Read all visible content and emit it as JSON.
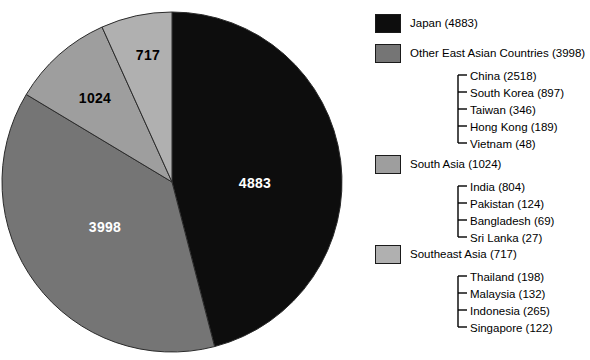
{
  "chart_data": {
    "type": "pie",
    "title": "",
    "legend_position": "right",
    "total": 10622,
    "categories": [
      "Japan",
      "Other East Asian Countries",
      "South Asia",
      "Southeast Asia"
    ],
    "values": [
      4883,
      3998,
      1024,
      717
    ],
    "colors": [
      "#0d0d0d",
      "#757575",
      "#9e9e9e",
      "#b0b0b0"
    ],
    "start_angle_deg": 0,
    "direction": "clockwise",
    "slices": [
      {
        "name": "Japan",
        "value": 4883,
        "label": "4883",
        "color": "#0d0d0d",
        "label_color": "#ffffff"
      },
      {
        "name": "Other East Asian Countries",
        "value": 3998,
        "label": "3998",
        "color": "#757575",
        "label_color": "#ffffff"
      },
      {
        "name": "South Asia",
        "value": 1024,
        "label": "1024",
        "color": "#9e9e9e",
        "label_color": "#000000"
      },
      {
        "name": "Southeast Asia",
        "value": 717,
        "label": "717",
        "color": "#b0b0b0",
        "label_color": "#000000"
      }
    ],
    "breakdown": {
      "Other East Asian Countries": [
        {
          "name": "China",
          "value": 2518
        },
        {
          "name": "South Korea",
          "value": 897
        },
        {
          "name": "Taiwan",
          "value": 346
        },
        {
          "name": "Hong Kong",
          "value": 189
        },
        {
          "name": "Vietnam",
          "value": 48
        }
      ],
      "South Asia": [
        {
          "name": "India",
          "value": 804
        },
        {
          "name": "Pakistan",
          "value": 124
        },
        {
          "name": "Bangladesh",
          "value": 69
        },
        {
          "name": "Sri Lanka",
          "value": 27
        }
      ],
      "Southeast Asia": [
        {
          "name": "Thailand",
          "value": 198
        },
        {
          "name": "Malaysia",
          "value": 132
        },
        {
          "name": "Indonesia",
          "value": 265
        },
        {
          "name": "Singapore",
          "value": 122
        }
      ]
    }
  },
  "pie": {
    "labels": [
      {
        "text": "4883",
        "x": 255,
        "y": 183,
        "tone": "light"
      },
      {
        "text": "3998",
        "x": 105,
        "y": 227,
        "tone": "light"
      },
      {
        "text": "1024",
        "x": 95,
        "y": 98,
        "tone": "dark"
      },
      {
        "text": "717",
        "x": 148,
        "y": 55,
        "tone": "dark"
      }
    ]
  },
  "legend": {
    "groups": [
      {
        "label": "Japan (4883)",
        "swatch": "#0d0d0d",
        "swatch_y": 14,
        "label_y": 17,
        "children": []
      },
      {
        "label": "Other East Asian Countries (3998)",
        "swatch": "#757575",
        "swatch_y": 44,
        "label_y": 47,
        "children": [
          {
            "label": "China (2518)",
            "y": 70
          },
          {
            "label": "South Korea (897)",
            "y": 87
          },
          {
            "label": "Taiwan (346)",
            "y": 104
          },
          {
            "label": "Hong Kong (189)",
            "y": 121
          },
          {
            "label": "Vietnam (48)",
            "y": 138
          }
        ]
      },
      {
        "label": "South Asia (1024)",
        "swatch": "#9e9e9e",
        "swatch_y": 155,
        "label_y": 158,
        "children": [
          {
            "label": "India (804)",
            "y": 181
          },
          {
            "label": "Pakistan (124)",
            "y": 198
          },
          {
            "label": "Bangladesh (69)",
            "y": 215
          },
          {
            "label": "Sri Lanka (27)",
            "y": 232
          }
        ]
      },
      {
        "label": "Southeast Asia (717)",
        "swatch": "#b0b0b0",
        "swatch_y": 245,
        "label_y": 248,
        "children": [
          {
            "label": "Thailand (198)",
            "y": 271
          },
          {
            "label": "Malaysia (132)",
            "y": 288
          },
          {
            "label": "Indonesia (265)",
            "y": 305
          },
          {
            "label": "Singapore (122)",
            "y": 322
          }
        ]
      }
    ],
    "bracket_x": 88,
    "child_text_x": 100
  }
}
